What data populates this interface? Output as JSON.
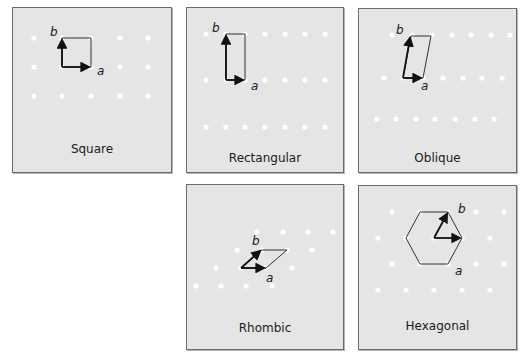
{
  "figure": {
    "colors": {
      "panel_bg": "#e5e5e5",
      "panel_border": "#6a6a6a",
      "lattice_point": "#ffffff",
      "vector": "#111111",
      "cell_outline": "#333333"
    },
    "panels": [
      {
        "id": "square",
        "label": "Square",
        "vector_a_label": "a",
        "vector_b_label": "b",
        "points": [
          [
            34,
            38
          ],
          [
            62,
            38
          ],
          [
            91,
            38
          ],
          [
            120,
            38
          ],
          [
            148,
            38
          ],
          [
            34,
            67
          ],
          [
            62,
            67
          ],
          [
            91,
            67
          ],
          [
            120,
            67
          ],
          [
            148,
            67
          ],
          [
            34,
            96
          ],
          [
            62,
            96
          ],
          [
            91,
            96
          ],
          [
            120,
            96
          ],
          [
            148,
            96
          ]
        ],
        "cell": [
          [
            62,
            67
          ],
          [
            91,
            67
          ],
          [
            91,
            38
          ],
          [
            62,
            38
          ]
        ],
        "origin": [
          62,
          67
        ],
        "a_end": [
          89,
          67
        ],
        "b_end": [
          62,
          40
        ]
      },
      {
        "id": "rectangular",
        "label": "Rectangular",
        "vector_a_label": "a",
        "vector_b_label": "b",
        "points": [
          [
            206,
            34
          ],
          [
            226,
            34
          ],
          [
            245,
            34
          ],
          [
            265,
            34
          ],
          [
            285,
            34
          ],
          [
            305,
            34
          ],
          [
            325,
            34
          ],
          [
            206,
            80
          ],
          [
            226,
            80
          ],
          [
            245,
            80
          ],
          [
            265,
            80
          ],
          [
            285,
            80
          ],
          [
            305,
            80
          ],
          [
            325,
            80
          ],
          [
            206,
            127
          ],
          [
            226,
            127
          ],
          [
            245,
            127
          ],
          [
            265,
            127
          ],
          [
            285,
            127
          ],
          [
            305,
            127
          ],
          [
            325,
            127
          ]
        ],
        "cell": [
          [
            226,
            80
          ],
          [
            245,
            80
          ],
          [
            245,
            34
          ],
          [
            226,
            34
          ]
        ],
        "origin": [
          226,
          80
        ],
        "a_end": [
          243,
          80
        ],
        "b_end": [
          226,
          36
        ]
      },
      {
        "id": "oblique",
        "label": "Oblique",
        "vector_a_label": "a",
        "vector_b_label": "b",
        "points": [
          [
            392,
            35
          ],
          [
            412,
            35
          ],
          [
            432,
            35
          ],
          [
            452,
            35
          ],
          [
            471,
            35
          ],
          [
            491,
            35
          ],
          [
            510,
            35
          ],
          [
            384,
            78
          ],
          [
            403,
            78
          ],
          [
            423,
            78
          ],
          [
            443,
            78
          ],
          [
            463,
            78
          ],
          [
            482,
            78
          ],
          [
            502,
            78
          ],
          [
            377,
            119
          ],
          [
            396,
            119
          ],
          [
            416,
            119
          ],
          [
            435,
            119
          ],
          [
            455,
            119
          ],
          [
            475,
            119
          ],
          [
            494,
            119
          ]
        ],
        "cell": [
          [
            403,
            78
          ],
          [
            423,
            78
          ],
          [
            431,
            36
          ],
          [
            411,
            36
          ]
        ],
        "origin": [
          403,
          78
        ],
        "a_end": [
          421,
          78
        ],
        "b_end": [
          410,
          38
        ]
      },
      {
        "id": "rhombic",
        "label": "Rhombic",
        "vector_a_label": "a",
        "vector_b_label": "b",
        "points": [
          [
            257,
            232
          ],
          [
            283,
            232
          ],
          [
            308,
            232
          ],
          [
            333,
            232
          ],
          [
            237,
            250
          ],
          [
            262,
            250
          ],
          [
            287,
            250
          ],
          [
            312,
            250
          ],
          [
            216,
            268
          ],
          [
            241,
            268
          ],
          [
            266,
            268
          ],
          [
            292,
            268
          ],
          [
            196,
            286
          ],
          [
            221,
            286
          ],
          [
            246,
            286
          ],
          [
            272,
            286
          ]
        ],
        "cell": [
          [
            241,
            268
          ],
          [
            266,
            268
          ],
          [
            287,
            250
          ],
          [
            262,
            250
          ]
        ],
        "origin": [
          241,
          268
        ],
        "a_end": [
          264,
          268
        ],
        "b_end": [
          260,
          251
        ]
      },
      {
        "id": "hexagonal",
        "label": "Hexagonal",
        "vector_a_label": "a",
        "vector_b_label": "b",
        "points": [
          [
            392,
            212
          ],
          [
            420,
            212
          ],
          [
            448,
            212
          ],
          [
            476,
            212
          ],
          [
            504,
            212
          ],
          [
            378,
            238
          ],
          [
            406,
            238
          ],
          [
            434,
            238
          ],
          [
            462,
            238
          ],
          [
            490,
            238
          ],
          [
            392,
            264
          ],
          [
            420,
            264
          ],
          [
            448,
            264
          ],
          [
            476,
            264
          ],
          [
            504,
            264
          ],
          [
            378,
            290
          ],
          [
            406,
            290
          ],
          [
            434,
            290
          ],
          [
            462,
            290
          ],
          [
            490,
            290
          ]
        ],
        "cell": [
          [
            462,
            238
          ],
          [
            448,
            212
          ],
          [
            420,
            212
          ],
          [
            406,
            238
          ],
          [
            420,
            264
          ],
          [
            448,
            264
          ]
        ],
        "origin": [
          434,
          238
        ],
        "a_end": [
          460,
          238
        ],
        "b_end": [
          447,
          214
        ]
      }
    ]
  }
}
